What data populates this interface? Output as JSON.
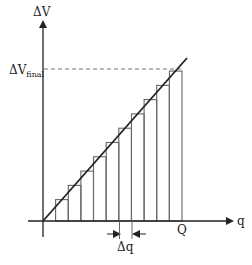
{
  "diagram": {
    "y_axis_label": "ΔV",
    "x_axis_label": "q",
    "final_value_label_main": "ΔV",
    "final_value_label_sub": "final",
    "x_end_label": "Q",
    "step_width_label": "Δq",
    "line_color": "#222222",
    "bar_color": "#666666",
    "dash_color": "#777777"
  },
  "chart_data": {
    "type": "line",
    "title": "",
    "xlabel": "q",
    "ylabel": "ΔV",
    "line": {
      "x": [
        0,
        1.0
      ],
      "y": [
        0,
        1.0
      ]
    },
    "steps": {
      "count": 11,
      "width_label": "Δq",
      "x_left": [
        0.0,
        0.0909,
        0.1818,
        0.2727,
        0.3636,
        0.4545,
        0.5455,
        0.6364,
        0.7273,
        0.8182,
        0.9091
      ],
      "heights": [
        0.045,
        0.136,
        0.227,
        0.318,
        0.409,
        0.5,
        0.591,
        0.682,
        0.773,
        0.864,
        0.955
      ]
    },
    "annotations": [
      "ΔV_final",
      "Q",
      "Δq"
    ],
    "grid": false
  }
}
